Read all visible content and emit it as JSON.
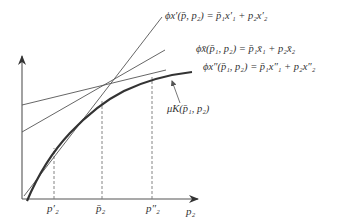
{
  "diagram": {
    "type": "economics-support-function",
    "colors": {
      "line": "#555555",
      "curve": "#333333",
      "text": "#333333",
      "dashed": "#777777"
    },
    "axes": {
      "x_label": "p₂",
      "y_label": ""
    },
    "ticks": [
      {
        "label": "p′₂",
        "x": 54
      },
      {
        "label": "p̄₂",
        "x": 102
      },
      {
        "label": "p″₂",
        "x": 152
      }
    ],
    "equations": {
      "line_prime": "ϕx′(p̄, p₂) = p̄₁x′₁ + p₂x′₂",
      "line_bar": "ϕx̄(p̄₁, p₂) = p̄₁x̄₁ + p₂x̄₂",
      "line_doubleprime": "ϕx″(p̄₁, p₂) = p̄₁x″₁ + p₂x″₂",
      "curve": "μK(p̄₁, p₂)"
    }
  }
}
